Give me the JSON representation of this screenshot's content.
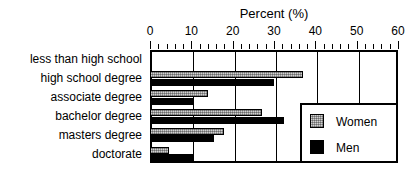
{
  "chart_data": {
    "type": "bar",
    "orientation": "horizontal",
    "title": "Percent (%)",
    "xlabel": "Percent (%)",
    "ylabel": "",
    "xlim": [
      0,
      60
    ],
    "xticks": [
      0,
      10,
      20,
      30,
      40,
      50,
      60
    ],
    "xtick_labels": [
      "0",
      "10",
      "20",
      "30",
      "40",
      "50",
      "60"
    ],
    "minor_tick_step": 2,
    "grid": true,
    "grid_axis": "x",
    "legend_position": "center-right-inside",
    "categories": [
      "less than high school",
      "high school degree",
      "associate degree",
      "bachelor degree",
      "masters degree",
      "doctorate"
    ],
    "series": [
      {
        "name": "Women",
        "color": "#9a9a9a",
        "pattern": "stippled",
        "values": [
          0.6,
          37.0,
          14.0,
          27.0,
          18.0,
          4.5
        ]
      },
      {
        "name": "Men",
        "color": "#000000",
        "pattern": "solid",
        "values": [
          0.5,
          30.0,
          10.5,
          32.5,
          15.5,
          10.5
        ]
      }
    ]
  },
  "legend": {
    "entries": [
      {
        "label": "Women",
        "swatch": "women-swatch"
      },
      {
        "label": "Men",
        "swatch": "men-swatch"
      }
    ]
  }
}
